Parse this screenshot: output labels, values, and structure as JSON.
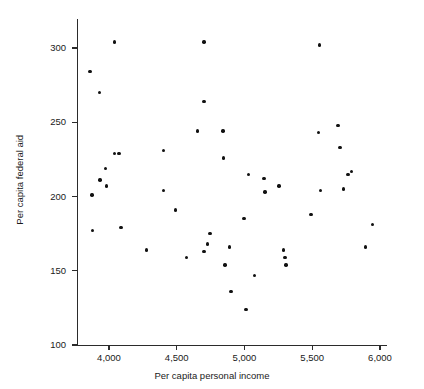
{
  "chart_data": {
    "type": "scatter",
    "title": "",
    "xlabel": "Per capita personal income",
    "ylabel": "Per capita federal aid",
    "xlim": [
      3820,
      6060
    ],
    "ylim": [
      100,
      320
    ],
    "xticks": [
      4000,
      4500,
      5000,
      5500,
      6000
    ],
    "xtick_labels": [
      "4,000",
      "4,500",
      "5,000",
      "5,500",
      "6,000"
    ],
    "yticks": [
      100,
      150,
      200,
      250,
      300
    ],
    "ytick_labels": [
      "100",
      "150",
      "200",
      "250",
      "300"
    ],
    "grid": false,
    "legend": null,
    "marker": {
      "shape": "circle",
      "color": "#111111",
      "size": 3.4
    },
    "points": [
      {
        "x": 3860,
        "y": 284
      },
      {
        "x": 3875,
        "y": 201
      },
      {
        "x": 3880,
        "y": 177
      },
      {
        "x": 3930,
        "y": 270
      },
      {
        "x": 3935,
        "y": 211
      },
      {
        "x": 3975,
        "y": 219
      },
      {
        "x": 3980,
        "y": 207
      },
      {
        "x": 4040,
        "y": 304
      },
      {
        "x": 4040,
        "y": 229
      },
      {
        "x": 4075,
        "y": 229
      },
      {
        "x": 4090,
        "y": 179
      },
      {
        "x": 4275,
        "y": 164
      },
      {
        "x": 4400,
        "y": 231
      },
      {
        "x": 4400,
        "y": 204
      },
      {
        "x": 4490,
        "y": 191
      },
      {
        "x": 4570,
        "y": 159
      },
      {
        "x": 4655,
        "y": 244
      },
      {
        "x": 4700,
        "y": 304
      },
      {
        "x": 4700,
        "y": 264
      },
      {
        "x": 4700,
        "y": 163
      },
      {
        "x": 4745,
        "y": 175
      },
      {
        "x": 4725,
        "y": 168
      },
      {
        "x": 4840,
        "y": 244
      },
      {
        "x": 4845,
        "y": 226
      },
      {
        "x": 4855,
        "y": 154
      },
      {
        "x": 4890,
        "y": 166
      },
      {
        "x": 4900,
        "y": 136
      },
      {
        "x": 4995,
        "y": 185
      },
      {
        "x": 5010,
        "y": 124
      },
      {
        "x": 5030,
        "y": 215
      },
      {
        "x": 5075,
        "y": 147
      },
      {
        "x": 5145,
        "y": 212
      },
      {
        "x": 5150,
        "y": 203
      },
      {
        "x": 5255,
        "y": 207
      },
      {
        "x": 5290,
        "y": 164
      },
      {
        "x": 5300,
        "y": 159
      },
      {
        "x": 5305,
        "y": 154
      },
      {
        "x": 5490,
        "y": 188
      },
      {
        "x": 5545,
        "y": 243
      },
      {
        "x": 5555,
        "y": 302
      },
      {
        "x": 5560,
        "y": 204
      },
      {
        "x": 5690,
        "y": 248
      },
      {
        "x": 5705,
        "y": 233
      },
      {
        "x": 5730,
        "y": 205
      },
      {
        "x": 5765,
        "y": 215
      },
      {
        "x": 5790,
        "y": 217
      },
      {
        "x": 5895,
        "y": 166
      },
      {
        "x": 5945,
        "y": 181
      }
    ]
  }
}
